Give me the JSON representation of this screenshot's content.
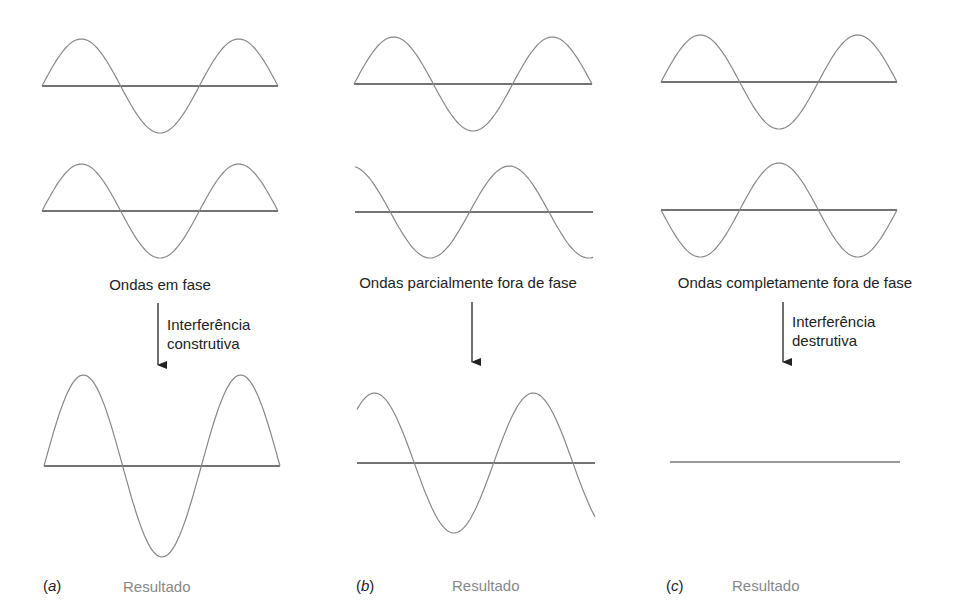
{
  "colors": {
    "wave": "#888888",
    "axis": "#444444",
    "text": "#222222",
    "result_text": "#888888",
    "background": "#ffffff"
  },
  "panels": [
    {
      "id": "a",
      "label_open": "(",
      "label_letter": "a",
      "label_close": ")",
      "description": "Ondas em fase",
      "arrow_label_line1": "Interferência",
      "arrow_label_line2": "construtiva",
      "result_label": "Resultado",
      "wave1": {
        "axis_y": 86,
        "x0": 42,
        "x1": 278,
        "amplitude": 47,
        "phase_deg": 0
      },
      "wave2": {
        "axis_y": 211,
        "x0": 42,
        "x1": 278,
        "amplitude": 47,
        "phase_deg": 0
      },
      "result": {
        "axis_y": 466,
        "x0": 44,
        "x1": 280,
        "amplitude": 91,
        "phase_deg": 0
      }
    },
    {
      "id": "b",
      "label_open": "(",
      "label_letter": "b",
      "label_close": ")",
      "description": "Ondas parcialmente fora de fase",
      "arrow_label_line1": "",
      "arrow_label_line2": "",
      "result_label": "Resultado",
      "wave1": {
        "axis_y": 84,
        "x0": 354,
        "x1": 592,
        "amplitude": 47,
        "phase_deg": 0
      },
      "wave2": {
        "axis_y": 212,
        "x0": 355,
        "x1": 593,
        "amplitude": 46,
        "phase_deg": 100
      },
      "result": {
        "axis_y": 463,
        "x0": 357,
        "x1": 595,
        "amplitude": 70,
        "phase_deg": 50
      }
    },
    {
      "id": "c",
      "label_open": "(",
      "label_letter": "c",
      "label_close": ")",
      "description": "Ondas completamente fora de fase",
      "arrow_label_line1": "Interferência",
      "arrow_label_line2": "destrutiva",
      "result_label": "Resultado",
      "wave1": {
        "axis_y": 82,
        "x0": 661,
        "x1": 897,
        "amplitude": 47,
        "phase_deg": 0
      },
      "wave2": {
        "axis_y": 210,
        "x0": 661,
        "x1": 897,
        "amplitude": 47,
        "phase_deg": 180
      },
      "result": {
        "axis_y": 462,
        "x0": 670,
        "x1": 900,
        "amplitude": 0,
        "phase_deg": 0
      }
    }
  ]
}
